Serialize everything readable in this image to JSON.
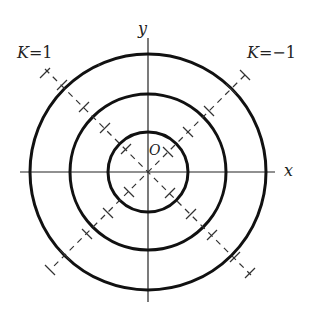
{
  "diagram": {
    "axes": {
      "x_label": "x",
      "y_label": "y",
      "origin_label": "O"
    },
    "circles": [
      {
        "r": 40
      },
      {
        "r": 78
      },
      {
        "r": 118
      }
    ],
    "lines": [
      {
        "label_var": "K",
        "label_eq": "=1",
        "direction": "y = -x"
      },
      {
        "label_var": "K",
        "label_eq": "=−1",
        "direction": "y = x"
      }
    ]
  }
}
